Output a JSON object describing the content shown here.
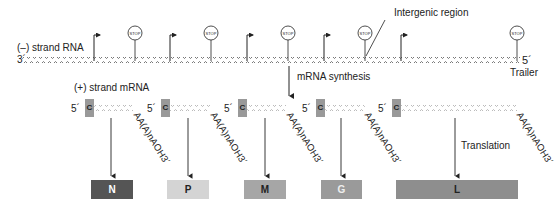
{
  "labels": {
    "minus_strand": "(–) strand RNA",
    "plus_strand": "(+) strand mRNA",
    "three_prime": "3´",
    "five_prime": "5´",
    "trailer": "Trailer",
    "intergenic": "Intergenic region",
    "mrna_synthesis": "mRNA synthesis",
    "translation": "Translation",
    "stop": "STOP",
    "cap": "C",
    "poly_a": "AA(A)nAOH3´"
  },
  "mrnas": [
    {
      "cap_x": 85,
      "five_x": 70,
      "polyA_x": 133
    },
    {
      "cap_x": 161,
      "five_x": 147,
      "polyA_x": 210
    },
    {
      "cap_x": 238,
      "five_x": 223,
      "polyA_x": 287
    },
    {
      "cap_x": 316,
      "five_x": 301,
      "polyA_x": 364
    },
    {
      "cap_x": 392,
      "five_x": 378,
      "polyA_x": 517
    }
  ],
  "proteins": [
    {
      "name": "N",
      "x": 91,
      "w": 42,
      "color": "#555555",
      "text": "#ffffff"
    },
    {
      "name": "P",
      "x": 167,
      "w": 42,
      "color": "#d4d4d4",
      "text": "#222222"
    },
    {
      "name": "M",
      "x": 244,
      "w": 42,
      "color": "#a6a6a6",
      "text": "#222222"
    },
    {
      "name": "G",
      "x": 321,
      "w": 41,
      "color": "#9a9a9a",
      "text": "#eeeeee"
    },
    {
      "name": "L",
      "x": 396,
      "w": 122,
      "color": "#8e8e8e",
      "text": "#222222"
    }
  ]
}
